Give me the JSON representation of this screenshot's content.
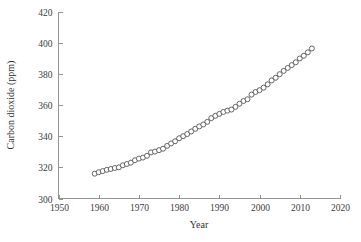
{
  "chart_data": {
    "type": "scatter",
    "title": "",
    "xlabel": "Year",
    "ylabel": "Carbon dioxide (ppm)",
    "xlim": [
      1950,
      2020
    ],
    "ylim": [
      300,
      420
    ],
    "xticks": [
      1950,
      1960,
      1970,
      1980,
      1990,
      2000,
      2010,
      2020
    ],
    "xticklabels": [
      "1950",
      "1960",
      "1970",
      "1980",
      "1990",
      "2000",
      "2010",
      "2020"
    ],
    "yticks": [
      300,
      320,
      340,
      360,
      380,
      400,
      420
    ],
    "yticklabels": [
      "300",
      "320",
      "340",
      "360",
      "380",
      "400",
      "420"
    ],
    "grid": false,
    "legend": null,
    "marker": "open-circle",
    "marker_color": "#4a4a4a",
    "marker_face_color": "#ffffff",
    "axis_color": "#8a8a8a",
    "background_color": "#ffffff",
    "x": [
      1959,
      1960,
      1961,
      1962,
      1963,
      1964,
      1965,
      1966,
      1967,
      1968,
      1969,
      1970,
      1971,
      1972,
      1973,
      1974,
      1975,
      1976,
      1977,
      1978,
      1979,
      1980,
      1981,
      1982,
      1983,
      1984,
      1985,
      1986,
      1987,
      1988,
      1989,
      1990,
      1991,
      1992,
      1993,
      1994,
      1995,
      1996,
      1997,
      1998,
      1999,
      2000,
      2001,
      2002,
      2003,
      2004,
      2005,
      2006,
      2007,
      2008,
      2009,
      2010,
      2011,
      2012,
      2013
    ],
    "y": [
      315.97,
      316.91,
      317.64,
      318.45,
      318.99,
      319.62,
      320.04,
      321.37,
      322.18,
      323.05,
      324.62,
      325.68,
      326.32,
      327.46,
      329.68,
      330.19,
      331.12,
      332.03,
      333.84,
      335.41,
      336.84,
      338.76,
      340.12,
      341.48,
      343.15,
      344.85,
      346.35,
      347.61,
      349.31,
      351.69,
      353.2,
      354.45,
      355.7,
      356.54,
      357.21,
      358.96,
      360.97,
      362.74,
      363.88,
      366.84,
      368.54,
      369.71,
      371.32,
      373.45,
      375.98,
      377.7,
      379.98,
      382.09,
      384.02,
      385.83,
      387.64,
      390.1,
      391.85,
      394.06,
      396.52
    ]
  },
  "axes": {
    "y_axis_title": "Carbon dioxide (ppm)",
    "x_axis_title": "Year"
  }
}
